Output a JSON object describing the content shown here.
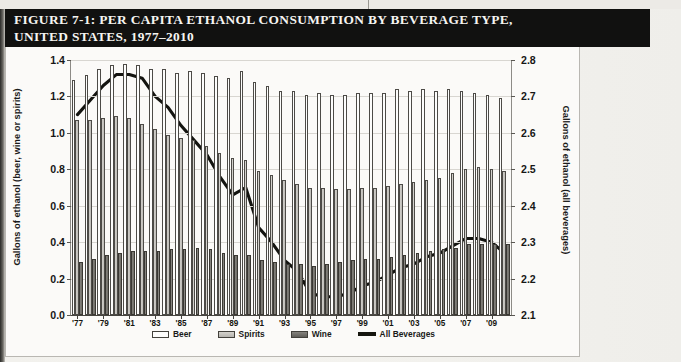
{
  "figure": {
    "title_line1": "FIGURE 7-1: PER CAPITA ETHANOL CONSUMPTION BY BEVERAGE TYPE,",
    "title_line2": "UNITED STATES, 1977–2010"
  },
  "legend": {
    "items": [
      {
        "label": "Beer",
        "swatch": "beer",
        "color": "#fdfdfc"
      },
      {
        "label": "Spirits",
        "swatch": "spirits",
        "color": "#c5c3be"
      },
      {
        "label": "Wine",
        "swatch": "wine",
        "color": "#716f6a"
      },
      {
        "label": "All Beverages",
        "swatch": "line",
        "color": "#16160f"
      }
    ]
  },
  "chart_data": {
    "type": "bar",
    "title": "FIGURE 7-1: PER CAPITA ETHANOL CONSUMPTION BY BEVERAGE TYPE, UNITED STATES, 1977–2010",
    "xlabel": "",
    "ylabel": "Gallons of ethanol (beer, wine or spirits)",
    "y2label": "Gallons of ethanol (all beverages)",
    "ylim": [
      0.0,
      1.4
    ],
    "y2lim": [
      2.1,
      2.8
    ],
    "yticks": [
      "0.0",
      "0.2",
      "0.4",
      "0.6",
      "0.8",
      "1.0",
      "1.2",
      "1.4"
    ],
    "y2ticks": [
      "2.1",
      "2.2",
      "2.3",
      "2.4",
      "2.5",
      "2.6",
      "2.7",
      "2.8"
    ],
    "grid": true,
    "legend_position": "bottom",
    "years": [
      1977,
      1978,
      1979,
      1980,
      1981,
      1982,
      1983,
      1984,
      1985,
      1986,
      1987,
      1988,
      1989,
      1990,
      1991,
      1992,
      1993,
      1994,
      1995,
      1996,
      1997,
      1998,
      1999,
      2000,
      2001,
      2002,
      2003,
      2004,
      2005,
      2006,
      2007,
      2008,
      2009,
      2010
    ],
    "xtick_labels": [
      "'77",
      "'79",
      "'81",
      "'83",
      "'85",
      "'87",
      "'89",
      "'91",
      "'93",
      "'95",
      "'97",
      "'99",
      "'01",
      "'03",
      "'05",
      "'07",
      "'09"
    ],
    "xtick_years": [
      1977,
      1979,
      1981,
      1983,
      1985,
      1987,
      1989,
      1991,
      1993,
      1995,
      1997,
      1999,
      2001,
      2003,
      2005,
      2007,
      2009
    ],
    "series": [
      {
        "name": "Beer",
        "axis": "left",
        "values": [
          1.29,
          1.32,
          1.35,
          1.37,
          1.38,
          1.37,
          1.35,
          1.35,
          1.33,
          1.34,
          1.33,
          1.31,
          1.3,
          1.34,
          1.28,
          1.26,
          1.23,
          1.23,
          1.21,
          1.22,
          1.21,
          1.21,
          1.22,
          1.22,
          1.22,
          1.24,
          1.23,
          1.24,
          1.23,
          1.24,
          1.23,
          1.22,
          1.21,
          1.19
        ]
      },
      {
        "name": "Spirits",
        "axis": "left",
        "values": [
          1.07,
          1.07,
          1.08,
          1.09,
          1.08,
          1.05,
          1.02,
          0.99,
          0.97,
          0.96,
          0.93,
          0.89,
          0.86,
          0.85,
          0.79,
          0.77,
          0.74,
          0.72,
          0.7,
          0.7,
          0.69,
          0.69,
          0.7,
          0.7,
          0.71,
          0.72,
          0.73,
          0.74,
          0.75,
          0.78,
          0.8,
          0.81,
          0.8,
          0.79
        ]
      },
      {
        "name": "Wine",
        "axis": "left",
        "values": [
          0.29,
          0.31,
          0.33,
          0.34,
          0.35,
          0.35,
          0.35,
          0.36,
          0.36,
          0.37,
          0.36,
          0.34,
          0.33,
          0.33,
          0.3,
          0.29,
          0.28,
          0.28,
          0.27,
          0.28,
          0.29,
          0.3,
          0.31,
          0.31,
          0.32,
          0.33,
          0.34,
          0.35,
          0.36,
          0.37,
          0.39,
          0.39,
          0.39,
          0.39
        ]
      },
      {
        "name": "All Beverages",
        "axis": "right",
        "type": "line",
        "values": [
          2.65,
          2.69,
          2.73,
          2.76,
          2.76,
          2.75,
          2.7,
          2.67,
          2.62,
          2.58,
          2.54,
          2.48,
          2.43,
          2.45,
          2.34,
          2.3,
          2.25,
          2.22,
          2.16,
          2.15,
          2.15,
          2.16,
          2.18,
          2.19,
          2.21,
          2.23,
          2.24,
          2.26,
          2.27,
          2.29,
          2.31,
          2.31,
          2.3,
          2.27
        ]
      }
    ]
  }
}
